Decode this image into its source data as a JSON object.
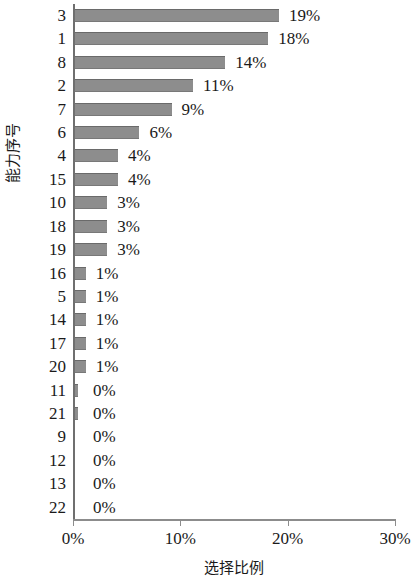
{
  "chart_data": {
    "type": "bar",
    "orientation": "horizontal",
    "title": "",
    "xlabel": "选择比例",
    "ylabel": "能力序号",
    "categories": [
      "3",
      "1",
      "8",
      "2",
      "7",
      "6",
      "4",
      "15",
      "10",
      "18",
      "19",
      "16",
      "5",
      "14",
      "17",
      "20",
      "11",
      "21",
      "9",
      "12",
      "13",
      "22"
    ],
    "values": [
      19,
      18,
      14,
      11,
      9,
      6,
      4,
      4,
      3,
      3,
      3,
      1,
      1,
      1,
      1,
      1,
      0,
      0,
      0,
      0,
      0,
      0
    ],
    "data_labels": [
      "19%",
      "18%",
      "14%",
      "11%",
      "9%",
      "6%",
      "4%",
      "4%",
      "3%",
      "3%",
      "3%",
      "1%",
      "1%",
      "1%",
      "1%",
      "1%",
      "0%",
      "0%",
      "0%",
      "0%",
      "0%",
      "0%"
    ],
    "xlim": [
      0,
      30
    ],
    "xticks": [
      0,
      10,
      20,
      30
    ],
    "xtick_labels": [
      "0%",
      "10%",
      "20%",
      "30%"
    ],
    "grid": false,
    "legend": null,
    "bar_color": "#8d8d8d",
    "axis_color": "#8c8c8c"
  }
}
